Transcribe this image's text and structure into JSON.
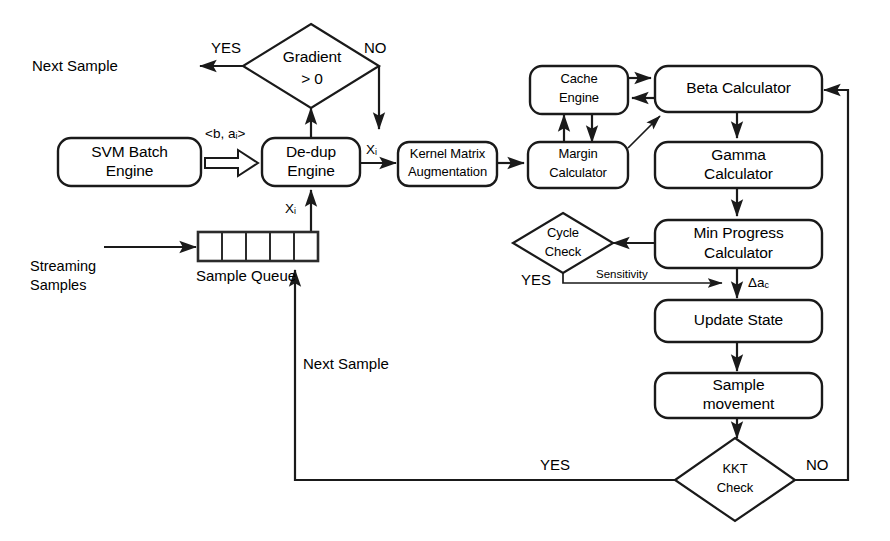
{
  "diagram": {
    "background_color": "#ffffff",
    "stroke_color": "#1a1a1a"
  },
  "nodes": {
    "svm_batch_engine": {
      "line1": "SVM Batch",
      "line2": "Engine",
      "shape": "rounded-rect"
    },
    "dedup_engine": {
      "line1": "De-dup",
      "line2": "Engine",
      "shape": "rounded-rect"
    },
    "kernel_matrix": {
      "line1": "Kernel Matrix",
      "line2": "Augmentation",
      "shape": "rounded-rect"
    },
    "margin_calculator": {
      "line1": "Margin",
      "line2": "Calculator",
      "shape": "rounded-rect"
    },
    "cache_engine": {
      "line1": "Cache",
      "line2": "Engine",
      "shape": "rounded-rect"
    },
    "beta_calculator": {
      "line1": "Beta Calculator",
      "shape": "rounded-rect"
    },
    "gamma_calculator": {
      "line1": "Gamma",
      "line2": "Calculator",
      "shape": "rounded-rect"
    },
    "min_progress_calculator": {
      "line1": "Min Progress",
      "line2": "Calculator",
      "shape": "rounded-rect"
    },
    "update_state": {
      "line1": "Update State",
      "shape": "rounded-rect"
    },
    "sample_movement": {
      "line1": "Sample",
      "line2": "movement",
      "shape": "rounded-rect"
    },
    "gradient_check": {
      "line1": "Gradient",
      "line2": "> 0",
      "shape": "diamond"
    },
    "cycle_check": {
      "line1": "Cycle",
      "line2": "Check",
      "shape": "diamond"
    },
    "kkt_check": {
      "line1": "KKT",
      "line2": "Check",
      "shape": "diamond"
    },
    "sample_queue": {
      "label": "Sample Queue",
      "cells": 5,
      "shape": "queue"
    }
  },
  "labels": {
    "next_sample_top": "Next Sample",
    "next_sample_loop": "Next Sample",
    "streaming_samples_line1": "Streaming",
    "streaming_samples_line2": "Samples",
    "gradient_yes": "YES",
    "gradient_no": "NO",
    "kkt_yes": "YES",
    "kkt_no": "NO",
    "cycle_yes": "YES",
    "sensitivity": "Sensitivity",
    "b_alpha_tuple": "<b, a",
    "b_alpha_tuple_sub": "i",
    "b_alpha_tuple_end": ">",
    "xi_queue_to_dedup": "X",
    "xi_queue_to_dedup_sub": "i",
    "xi_dedup_to_kernel": "X",
    "xi_dedup_to_kernel_sub": "i",
    "delta_alpha_c": "Δa",
    "delta_alpha_c_sub": "c"
  },
  "edges": [
    {
      "id": "svm-to-dedup",
      "from": "svm_batch_engine",
      "to": "dedup_engine",
      "label": "<b, a_i>",
      "style": "block-arrow"
    },
    {
      "id": "queue-to-dedup",
      "from": "sample_queue",
      "to": "dedup_engine",
      "label": "X_i",
      "style": "arrow"
    },
    {
      "id": "dedup-to-gradient",
      "from": "dedup_engine",
      "to": "gradient_check",
      "label": "",
      "style": "arrow"
    },
    {
      "id": "gradient-yes-next-sample",
      "from": "gradient_check",
      "to": "next_sample_top",
      "label": "YES",
      "style": "arrow"
    },
    {
      "id": "gradient-no-to-kernel",
      "from": "gradient_check",
      "to": "kernel_matrix",
      "label": "NO",
      "style": "arrow"
    },
    {
      "id": "dedup-to-kernel",
      "from": "dedup_engine",
      "to": "kernel_matrix",
      "label": "X_i",
      "style": "arrow"
    },
    {
      "id": "kernel-to-margin",
      "from": "kernel_matrix",
      "to": "margin_calculator",
      "label": "",
      "style": "arrow"
    },
    {
      "id": "margin-to-cache",
      "from": "margin_calculator",
      "to": "cache_engine",
      "label": "",
      "style": "arrow"
    },
    {
      "id": "cache-to-margin",
      "from": "cache_engine",
      "to": "margin_calculator",
      "label": "",
      "style": "arrow"
    },
    {
      "id": "cache-to-beta",
      "from": "cache_engine",
      "to": "beta_calculator",
      "label": "",
      "style": "arrow"
    },
    {
      "id": "beta-to-cache",
      "from": "beta_calculator",
      "to": "cache_engine",
      "label": "",
      "style": "arrow"
    },
    {
      "id": "margin-to-beta",
      "from": "margin_calculator",
      "to": "beta_calculator",
      "label": "",
      "style": "arrow-diagonal"
    },
    {
      "id": "beta-to-gamma",
      "from": "beta_calculator",
      "to": "gamma_calculator",
      "label": "",
      "style": "arrow"
    },
    {
      "id": "gamma-to-minprogress",
      "from": "gamma_calculator",
      "to": "min_progress_calculator",
      "label": "",
      "style": "arrow"
    },
    {
      "id": "minprogress-to-cycle",
      "from": "min_progress_calculator",
      "to": "cycle_check",
      "label": "",
      "style": "arrow"
    },
    {
      "id": "cycle-yes-sensitivity",
      "from": "cycle_check",
      "to": "update_state",
      "label": "Sensitivity",
      "style": "arrow"
    },
    {
      "id": "minprogress-to-update",
      "from": "min_progress_calculator",
      "to": "update_state",
      "label": "Δa_c",
      "style": "arrow"
    },
    {
      "id": "update-to-samplemovement",
      "from": "update_state",
      "to": "sample_movement",
      "label": "",
      "style": "arrow"
    },
    {
      "id": "samplemovement-to-kkt",
      "from": "sample_movement",
      "to": "kkt_check",
      "label": "",
      "style": "arrow"
    },
    {
      "id": "kkt-yes-to-queue",
      "from": "kkt_check",
      "to": "sample_queue",
      "label": "YES",
      "style": "arrow"
    },
    {
      "id": "kkt-no-to-beta",
      "from": "kkt_check",
      "to": "beta_calculator",
      "label": "NO",
      "style": "arrow"
    },
    {
      "id": "streaming-to-queue",
      "from": "streaming_samples",
      "to": "sample_queue",
      "label": "",
      "style": "arrow"
    }
  ]
}
